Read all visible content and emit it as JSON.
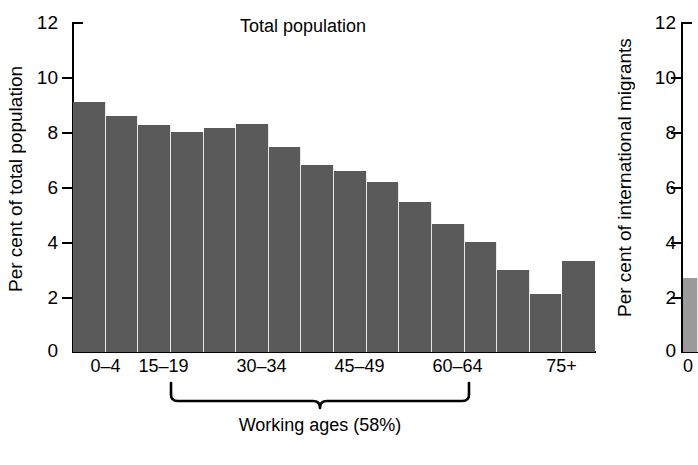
{
  "chart_data": [
    {
      "type": "bar",
      "title": "Total population",
      "xlabel": "",
      "ylabel": "Per cent of total population",
      "ylim": [
        0,
        12
      ],
      "yticks": [
        0,
        2,
        4,
        6,
        8,
        10,
        12
      ],
      "ytick_labels": [
        "0",
        "2",
        "4",
        "6",
        "8",
        "10",
        "12"
      ],
      "grid": false,
      "legend": "none",
      "categories": [
        "0–4",
        "5–9",
        "10–14",
        "15–19",
        "20–24",
        "25–29",
        "30–34",
        "35–39",
        "40–44",
        "45–49",
        "50–54",
        "55–59",
        "60–64",
        "65–69",
        "70–74",
        "75+"
      ],
      "visible_xtick_labels": [
        "0–4",
        "15–19",
        "30–34",
        "45–49",
        "60–64",
        "75+"
      ],
      "values": [
        9.1,
        8.6,
        8.25,
        8.0,
        8.15,
        8.3,
        7.45,
        6.8,
        6.6,
        6.2,
        5.45,
        4.65,
        4.0,
        3.0,
        2.1,
        3.3
      ],
      "bar_color": "#5a5a5a",
      "annotation": {
        "text": "Working ages (58%)",
        "spans_categories": [
          "15–19",
          "60–64"
        ]
      }
    },
    {
      "type": "bar",
      "title": "",
      "xlabel": "",
      "ylabel": "Per cent of international migrants",
      "ylim": [
        0,
        12
      ],
      "yticks": [
        0,
        2,
        4,
        6,
        8,
        10,
        12
      ],
      "ytick_labels": [
        "0",
        "2",
        "4",
        "6",
        "8",
        "10",
        "12"
      ],
      "grid": false,
      "legend": "none",
      "categories": [
        "0–4"
      ],
      "values": [
        2.7
      ],
      "bar_color": "#9a9a9a",
      "clipped": "true"
    }
  ],
  "left_panel": {
    "ylabel": "Per cent of total population",
    "title": "Total population",
    "ytick_labels": [
      "12",
      "10",
      "8",
      "6",
      "4",
      "2",
      "0"
    ],
    "xtick_labels": [
      "0–4",
      "15–19",
      "30–34",
      "45–49",
      "60–64",
      "75+"
    ],
    "brace_label": "Working ages (58%)",
    "bar_color": "#5a5a5a"
  },
  "right_panel": {
    "ylabel": "Per cent of international migrants",
    "ytick_labels": [
      "12",
      "10",
      "8",
      "6",
      "4",
      "2",
      "0"
    ],
    "xtick_labels": [
      "0"
    ],
    "bar_color": "#9a9a9a"
  }
}
